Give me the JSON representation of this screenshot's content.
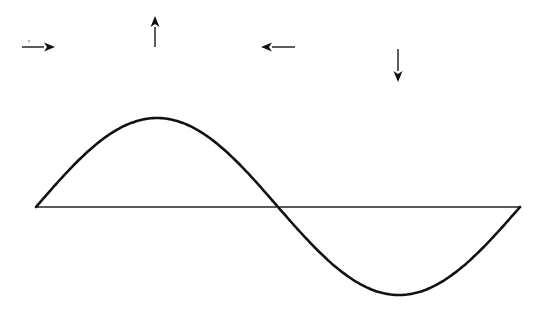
{
  "diagram": {
    "colors": {
      "background": "#ffffff",
      "curve": "#111111",
      "axis": "#222222",
      "arrow": "#111111"
    },
    "baseline": {
      "x1": 36,
      "x2": 520,
      "y": 207
    },
    "wave": {
      "type": "sine",
      "cycles": 1,
      "start": [
        36,
        207
      ],
      "crest": [
        155,
        118
      ],
      "zero_crossing": [
        278,
        207
      ],
      "trough": [
        398,
        295
      ],
      "end": [
        520,
        207
      ]
    },
    "arrows": [
      {
        "name": "arrow-right",
        "direction": "right",
        "x1": 22,
        "y1": 47,
        "x2": 55,
        "y2": 47
      },
      {
        "name": "arrow-up",
        "direction": "up",
        "x1": 155,
        "y1": 47,
        "x2": 155,
        "y2": 16
      },
      {
        "name": "arrow-left",
        "direction": "left",
        "x1": 295,
        "y1": 47,
        "x2": 261,
        "y2": 47
      },
      {
        "name": "arrow-down",
        "direction": "down",
        "x1": 398,
        "y1": 49,
        "x2": 398,
        "y2": 82
      }
    ]
  }
}
